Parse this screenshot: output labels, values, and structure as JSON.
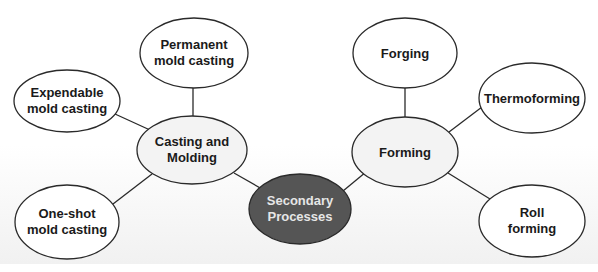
{
  "diagram": {
    "title": "",
    "colors": {
      "line": "#2a2a2a",
      "leaf_fill": "#ffffff",
      "hub_fill": "#f3f3f3",
      "center_fill": "#555555",
      "center_text": "#e6e6e6",
      "text": "#1a1a1a"
    },
    "center": {
      "id": "secondary-processes",
      "label_line1": "Secondary",
      "label_line2": "Processes"
    },
    "hubs": [
      {
        "id": "casting-and-molding",
        "label_line1": "Casting and",
        "label_line2": "Molding"
      },
      {
        "id": "forming",
        "label_line1": "Forming",
        "label_line2": ""
      }
    ],
    "leaves": [
      {
        "id": "permanent-mold-casting",
        "parent": "casting-and-molding",
        "label_line1": "Permanent",
        "label_line2": "mold casting"
      },
      {
        "id": "expendable-mold-casting",
        "parent": "casting-and-molding",
        "label_line1": "Expendable",
        "label_line2": "mold casting"
      },
      {
        "id": "one-shot-mold-casting",
        "parent": "casting-and-molding",
        "label_line1": "One-shot",
        "label_line2": "mold casting"
      },
      {
        "id": "forging",
        "parent": "forming",
        "label_line1": "Forging",
        "label_line2": ""
      },
      {
        "id": "thermoforming",
        "parent": "forming",
        "label_line1": "Thermoforming",
        "label_line2": ""
      },
      {
        "id": "roll-forming",
        "parent": "forming",
        "label_line1": "Roll",
        "label_line2": "forming"
      }
    ]
  }
}
